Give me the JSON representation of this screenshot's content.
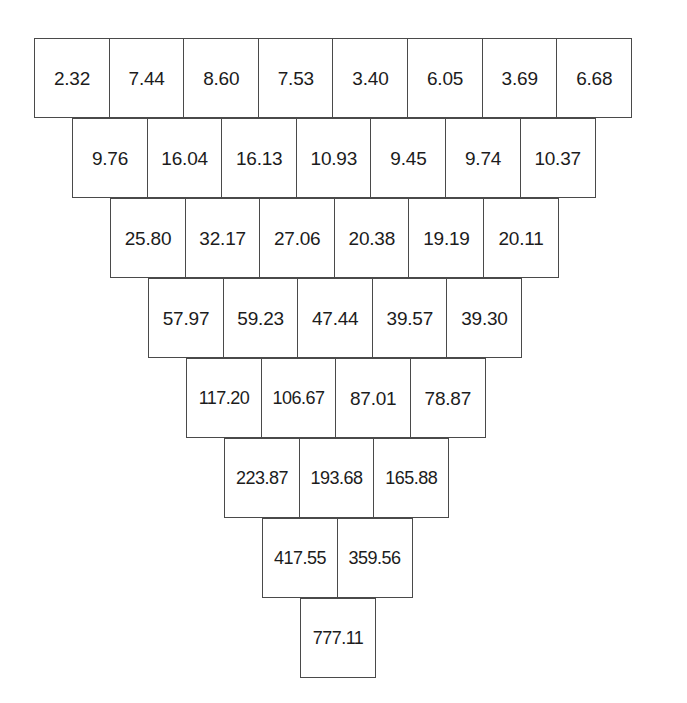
{
  "figure": {
    "kind": "inverted-sum-pyramid",
    "rows_count": 8,
    "cell_border_color": "#4a4a4a",
    "text_color": "#1c1c1c",
    "background_color": "#ffffff"
  },
  "chart_data": {
    "type": "table",
    "title": "",
    "subtitle": "",
    "xlabel": "",
    "ylabel": "",
    "layout": "inverted pyramid; each row offset right by half a cell; each cell equals the sum of the two cells above it",
    "grid": true,
    "legend": null,
    "rows": [
      {
        "level": 1,
        "count": 8,
        "offset_cells": 0,
        "values": [
          "2.32",
          "7.44",
          "8.60",
          "7.53",
          "3.40",
          "6.05",
          "3.69",
          "6.68"
        ]
      },
      {
        "level": 2,
        "count": 7,
        "offset_cells": 0.5,
        "values": [
          "9.76",
          "16.04",
          "16.13",
          "10.93",
          "9.45",
          "9.74",
          "10.37"
        ]
      },
      {
        "level": 3,
        "count": 6,
        "offset_cells": 1.0,
        "values": [
          "25.80",
          "32.17",
          "27.06",
          "20.38",
          "19.19",
          "20.11"
        ]
      },
      {
        "level": 4,
        "count": 5,
        "offset_cells": 1.5,
        "values": [
          "57.97",
          "59.23",
          "47.44",
          "39.57",
          "39.30"
        ]
      },
      {
        "level": 5,
        "count": 4,
        "offset_cells": 2.0,
        "values": [
          "117.20",
          "106.67",
          "87.01",
          "78.87"
        ]
      },
      {
        "level": 6,
        "count": 3,
        "offset_cells": 2.5,
        "values": [
          "223.87",
          "193.68",
          "165.88"
        ]
      },
      {
        "level": 7,
        "count": 2,
        "offset_cells": 3.0,
        "values": [
          "417.55",
          "359.56"
        ]
      },
      {
        "level": 8,
        "count": 1,
        "offset_cells": 3.5,
        "values": [
          "777.11"
        ]
      }
    ]
  }
}
